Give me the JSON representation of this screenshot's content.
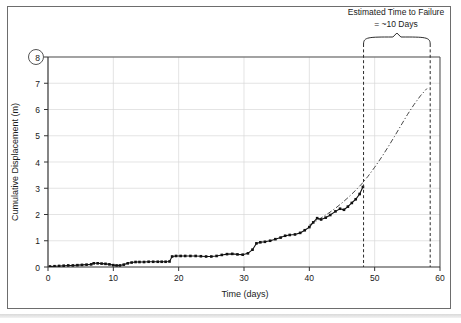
{
  "chart_data": {
    "type": "line",
    "title": "",
    "xlabel": "Time (days)",
    "ylabel": "Cumulative Displacement (m)",
    "xlim": [
      0,
      60
    ],
    "ylim": [
      0,
      8
    ],
    "xticks": [
      0,
      10,
      20,
      30,
      40,
      50,
      60
    ],
    "yticks": [
      0,
      1,
      2,
      3,
      4,
      5,
      6,
      7,
      8
    ],
    "grid": true,
    "legend": "none",
    "series": [
      {
        "name": "Measured cumulative displacement",
        "style": "solid-with-square-markers",
        "color": "#111111",
        "x": [
          0.3,
          1.0,
          1.7,
          2.4,
          3.1,
          3.8,
          4.5,
          5.2,
          5.9,
          6.6,
          7.0,
          7.6,
          8.2,
          8.8,
          9.4,
          10.0,
          10.5,
          11.0,
          11.6,
          12.2,
          12.8,
          13.4,
          14.0,
          14.7,
          15.4,
          16.1,
          16.8,
          17.4,
          18.0,
          18.6,
          19.0,
          19.6,
          20.3,
          21.0,
          21.8,
          22.6,
          23.4,
          24.2,
          25.0,
          25.8,
          26.6,
          27.4,
          28.2,
          29.0,
          29.8,
          30.6,
          31.3,
          31.9,
          32.5,
          33.2,
          34.0,
          34.8,
          35.6,
          36.3,
          37.0,
          37.8,
          38.6,
          39.3,
          40.0,
          40.6,
          41.2,
          41.8,
          42.5,
          43.2,
          44.0,
          44.7,
          45.3,
          45.9,
          46.5,
          47.1,
          47.7,
          48.2
        ],
        "y": [
          0.02,
          0.03,
          0.04,
          0.05,
          0.06,
          0.06,
          0.07,
          0.08,
          0.09,
          0.1,
          0.14,
          0.14,
          0.13,
          0.12,
          0.1,
          0.07,
          0.06,
          0.06,
          0.09,
          0.14,
          0.17,
          0.19,
          0.19,
          0.19,
          0.2,
          0.2,
          0.2,
          0.2,
          0.2,
          0.21,
          0.4,
          0.42,
          0.42,
          0.42,
          0.42,
          0.42,
          0.41,
          0.4,
          0.4,
          0.42,
          0.46,
          0.49,
          0.5,
          0.48,
          0.47,
          0.52,
          0.66,
          0.9,
          0.94,
          0.96,
          1.0,
          1.06,
          1.12,
          1.19,
          1.22,
          1.24,
          1.3,
          1.4,
          1.52,
          1.7,
          1.86,
          1.81,
          1.88,
          1.98,
          2.12,
          2.22,
          2.18,
          2.3,
          2.44,
          2.58,
          2.78,
          3.05
        ]
      },
      {
        "name": "Fitted / extrapolated failure-prediction curve",
        "style": "dash-dot",
        "color": "#333333",
        "x": [
          40.0,
          41.0,
          42.0,
          43.0,
          44.0,
          45.0,
          46.0,
          47.0,
          48.0,
          49.0,
          50.0,
          51.0,
          52.0,
          53.0,
          54.0,
          55.0,
          56.0,
          57.0,
          58.0
        ],
        "y": [
          1.6,
          1.74,
          1.9,
          2.06,
          2.24,
          2.44,
          2.66,
          2.9,
          3.16,
          3.46,
          3.8,
          4.16,
          4.55,
          4.96,
          5.38,
          5.8,
          6.18,
          6.52,
          6.8
        ]
      }
    ],
    "markers": [
      {
        "name": "failure-threshold-callout",
        "label": "8",
        "kind": "circled-y-tick",
        "y": 8
      }
    ],
    "vertical_lines": [
      {
        "name": "last-measurement-line",
        "x": 48.3,
        "style": "dashed"
      },
      {
        "name": "predicted-failure-line",
        "x": 58.5,
        "style": "dashed"
      }
    ],
    "annotations": [
      {
        "name": "estimated-time-to-failure",
        "line1": "Estimated Time to Failure",
        "line2": "= ~10 Days",
        "brace_from_x": 48.3,
        "brace_to_x": 58.5
      }
    ]
  },
  "colors": {
    "frame": "#6d6d6d",
    "axis": "#4d4d4d",
    "grid": "#d8d8d8",
    "data": "#111111",
    "fit": "#333333",
    "text": "#1a1a1a"
  }
}
